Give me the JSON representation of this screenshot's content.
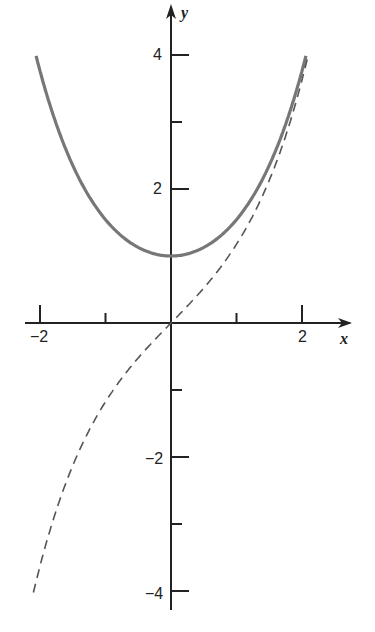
{
  "chart_data": {
    "type": "line",
    "title": "",
    "xlabel": "x",
    "ylabel": "y",
    "xlim": [
      -2,
      2
    ],
    "ylim": [
      -4,
      4
    ],
    "x_ticks": [
      -2,
      -1,
      0,
      1,
      2
    ],
    "x_tick_labels": [
      "-2",
      "",
      "",
      "",
      "2"
    ],
    "y_ticks": [
      -4,
      -3,
      -2,
      -1,
      0,
      1,
      2,
      3,
      4
    ],
    "y_tick_labels": [
      "-4",
      "",
      "-2",
      "",
      "",
      "",
      "2",
      "",
      "4"
    ],
    "grid": false,
    "legend": null,
    "series": [
      {
        "name": "cosh x",
        "style": "solid",
        "color": "#777777",
        "x": [
          -2.06,
          -1.5,
          -1,
          -0.5,
          0,
          0.5,
          1,
          1.5,
          2.06
        ],
        "values": [
          3.99,
          2.35,
          1.54,
          1.13,
          1.0,
          1.13,
          1.54,
          2.35,
          3.99
        ]
      },
      {
        "name": "sinh x",
        "style": "dashed",
        "color": "#555555",
        "x": [
          -2.1,
          -1.5,
          -1,
          -0.5,
          0,
          0.5,
          1,
          1.5,
          2.1
        ],
        "values": [
          -4.02,
          -2.13,
          -1.18,
          -0.52,
          0,
          0.52,
          1.18,
          2.13,
          4.02
        ]
      }
    ]
  },
  "labels": {
    "x_axis": "x",
    "y_axis": "y",
    "x_neg2": "−2",
    "x_pos2": "2",
    "y_pos4": "4",
    "y_pos2": "2",
    "y_neg2": "−2",
    "y_neg4": "−4"
  }
}
